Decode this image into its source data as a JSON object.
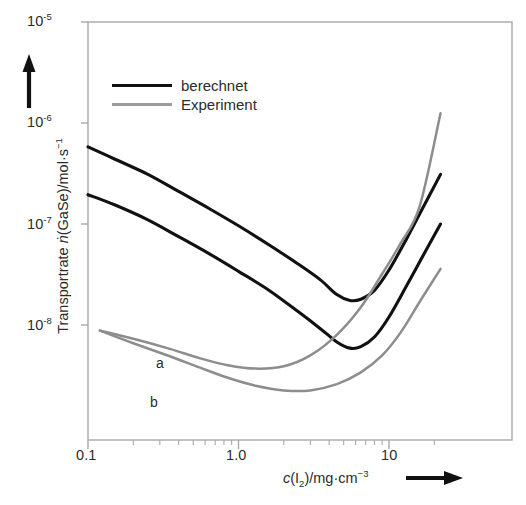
{
  "chart_data": {
    "type": "line",
    "title": "",
    "xlabel": "c(I2)/mg·cm-3",
    "ylabel": "Transportrate ṅ(GaSe)/mol·s-1",
    "xscale": "log",
    "yscale": "log",
    "xlim": [
      0.1,
      25
    ],
    "ylim": [
      1.5e-09,
      1e-05
    ],
    "grid": false,
    "legend_position": "upper-left-inside",
    "xticks": [
      {
        "value": 0.1,
        "label": "0.1"
      },
      {
        "value": 1.0,
        "label": "1.0"
      },
      {
        "value": 10,
        "label": "10"
      }
    ],
    "yticks": [
      {
        "value": 1e-05,
        "label": "10",
        "exponent": "-5"
      },
      {
        "value": 1e-06,
        "label": "10",
        "exponent": "-6"
      },
      {
        "value": 1e-07,
        "label": "10",
        "exponent": "-7"
      },
      {
        "value": 1e-08,
        "label": "10",
        "exponent": "-8"
      }
    ],
    "series": [
      {
        "name": "berechnet a",
        "style": "calculated",
        "color": "#111111",
        "annotation": "",
        "points": [
          [
            0.1,
            5.8e-07
          ],
          [
            0.15,
            4.4e-07
          ],
          [
            0.25,
            3.1e-07
          ],
          [
            0.4,
            2.1e-07
          ],
          [
            0.65,
            1.4e-07
          ],
          [
            1.0,
            9.6e-08
          ],
          [
            1.6,
            6.2e-08
          ],
          [
            2.5,
            4e-08
          ],
          [
            3.5,
            2.8e-08
          ],
          [
            4.5,
            2e-08
          ],
          [
            5.5,
            1.75e-08
          ],
          [
            6.5,
            1.8e-08
          ],
          [
            8.0,
            2.2e-08
          ],
          [
            10.0,
            3.5e-08
          ],
          [
            13.0,
            7e-08
          ],
          [
            17.0,
            1.5e-07
          ],
          [
            22.0,
            3.1e-07
          ]
        ]
      },
      {
        "name": "berechnet b",
        "style": "calculated",
        "color": "#111111",
        "annotation": "",
        "points": [
          [
            0.1,
            1.95e-07
          ],
          [
            0.15,
            1.55e-07
          ],
          [
            0.25,
            1.1e-07
          ],
          [
            0.4,
            7.5e-08
          ],
          [
            0.65,
            5e-08
          ],
          [
            1.0,
            3.4e-08
          ],
          [
            1.6,
            2.2e-08
          ],
          [
            2.5,
            1.35e-08
          ],
          [
            3.5,
            9.2e-09
          ],
          [
            4.5,
            6.8e-09
          ],
          [
            5.5,
            5.9e-09
          ],
          [
            6.5,
            6.1e-09
          ],
          [
            8.0,
            7.6e-09
          ],
          [
            10.0,
            1.2e-08
          ],
          [
            13.0,
            2.4e-08
          ],
          [
            17.0,
            5e-08
          ],
          [
            22.0,
            1e-07
          ]
        ]
      },
      {
        "name": "Experiment a",
        "style": "experiment",
        "color": "#8d8d8d",
        "annotation": "a",
        "points": [
          [
            0.12,
            8.8e-09
          ],
          [
            0.2,
            7.3e-09
          ],
          [
            0.35,
            5.8e-09
          ],
          [
            0.55,
            4.7e-09
          ],
          [
            0.85,
            4e-09
          ],
          [
            1.3,
            3.7e-09
          ],
          [
            2.0,
            3.9e-09
          ],
          [
            3.0,
            5e-09
          ],
          [
            4.5,
            8e-09
          ],
          [
            6.5,
            1.5e-08
          ],
          [
            9.0,
            3.2e-08
          ],
          [
            12.0,
            6.5e-08
          ],
          [
            16.0,
            1.5e-07
          ],
          [
            22.0,
            1.25e-06
          ]
        ]
      },
      {
        "name": "Experiment b",
        "style": "experiment",
        "color": "#8d8d8d",
        "annotation": "b",
        "points": [
          [
            0.12,
            8.8e-09
          ],
          [
            0.2,
            6.6e-09
          ],
          [
            0.35,
            4.9e-09
          ],
          [
            0.55,
            3.8e-09
          ],
          [
            0.85,
            3e-09
          ],
          [
            1.3,
            2.5e-09
          ],
          [
            2.0,
            2.25e-09
          ],
          [
            3.0,
            2.25e-09
          ],
          [
            4.5,
            2.6e-09
          ],
          [
            6.5,
            3.4e-09
          ],
          [
            9.0,
            5e-09
          ],
          [
            12.0,
            8.5e-09
          ],
          [
            16.0,
            1.7e-08
          ],
          [
            22.0,
            3.6e-08
          ]
        ]
      }
    ],
    "annotations": [
      {
        "text": "a",
        "x": 0.58,
        "y": 6.5e-09
      },
      {
        "text": "b",
        "x": 0.52,
        "y": 3.1e-09
      }
    ]
  },
  "legend": {
    "entries": [
      {
        "label": "berechnet",
        "color": "#111111",
        "style": "calculated"
      },
      {
        "label": "Experiment",
        "color": "#9a9a9a",
        "style": "experiment"
      }
    ]
  },
  "axes": {
    "y": {
      "title_prefix": "Transportrate ",
      "title_symbol": "ṅ",
      "title_suffix": "(GaSe)/mol·s",
      "title_exponent": "−1",
      "ticks": [
        "10",
        "10",
        "10",
        "10"
      ],
      "tick_exponents": [
        "-5",
        "-6",
        "-7",
        "-8"
      ]
    },
    "x": {
      "title_symbol": "c",
      "title_paren_open": "(I",
      "title_sub": "2",
      "title_paren_close": ")/mg·cm",
      "title_exponent": "−3",
      "ticks": [
        "0.1",
        "1.0",
        "10"
      ]
    }
  },
  "colors": {
    "calculated": "#111111",
    "experiment": "#8d8d8d",
    "frame": "#a8a8a8",
    "text": "#2b2b2b"
  }
}
